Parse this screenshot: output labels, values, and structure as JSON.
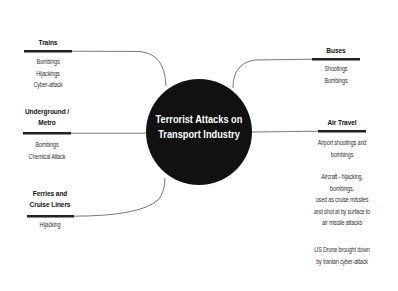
{
  "center": {
    "title_line1": "Terrorist Attacks on",
    "title_line2": "Transport Industry"
  },
  "branches": {
    "trains": {
      "title": "Trains",
      "items": "Bombings\nHijackings\nCyber-attack"
    },
    "underground": {
      "title_line1": "Underground /",
      "title_line2": "Metro",
      "items": "Bombings\nChemical Attack"
    },
    "ferries": {
      "title_line1": "Ferries and",
      "title_line2": "Cruise Liners",
      "items": "Hijacking"
    },
    "buses": {
      "title": "Buses",
      "items": "Shootings\nBombings"
    },
    "air_travel": {
      "title": "Air Travel",
      "items_block1": "Airport shootings and\nbombings",
      "items_block2": "Aircraft - hijacking,\nbombings,\nused as cruise missiles\nand shot at by surface to\nair missile attacks",
      "items_block3": "US Drone brought down\nby Iranian cyber-attack"
    }
  },
  "colors": {
    "center_fill": "#111111",
    "connector": "#555555",
    "bar": "#222222"
  }
}
